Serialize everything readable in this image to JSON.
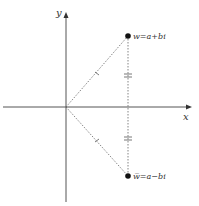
{
  "axes": {
    "x_label": "x",
    "y_label": "y"
  },
  "points": {
    "w": {
      "label": "w=a+bi"
    },
    "w_conj": {
      "label": "w̅=a−bi"
    }
  },
  "colors": {
    "axis": "#555555",
    "dashed": "#666666",
    "point": "#111111",
    "text": "#333333"
  }
}
